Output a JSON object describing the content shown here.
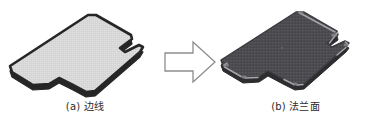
{
  "figure": {
    "background_color": "#ffffff",
    "width": 376,
    "height": 125,
    "panels": [
      {
        "id": "a",
        "caption_index": "(a)",
        "caption_text": "边线",
        "caption_full": "(a) 边线",
        "object_name": "sheet-metal-outline-part",
        "fill_color": "#d9d9d9",
        "edge_color": "#262626",
        "description_role": "edge-line-source-geometry"
      },
      {
        "id": "b",
        "caption_index": "(b)",
        "caption_text": "法兰面",
        "caption_full": "(b) 法兰面",
        "object_name": "sheet-metal-flange-face-part",
        "fill_color": "#4e4e52",
        "edge_color": "#2a2a2d",
        "highlight_color": "#9a9a9e",
        "description_role": "flange-face-result-geometry"
      }
    ],
    "arrow": {
      "name": "block-arrow-right",
      "direction": "right",
      "stroke_color": "#8a8a8a",
      "fill_color": "#ffffff"
    }
  }
}
